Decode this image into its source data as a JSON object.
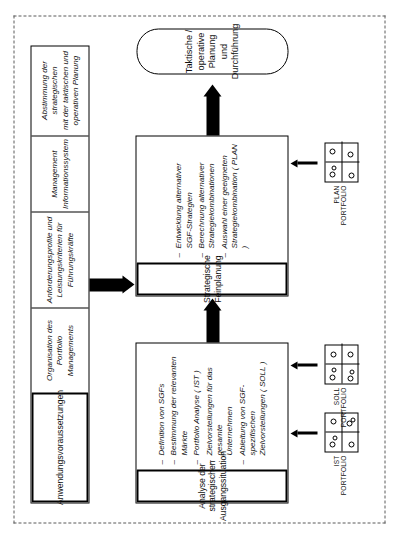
{
  "diagram": {
    "frame_style": "dashed"
  },
  "top_box": {
    "header": "Anwendungsvoraussetzungen",
    "cells": [
      "Organisation des\nPortfolio Managements",
      "Anforderungsprofile und\nLeistungskriterien für\nFührungskräfte",
      "Management\nInformationssystem",
      "Abstimmung der strategischen\nmit der taktischen und\noperativen Planung"
    ]
  },
  "analysis_box": {
    "header": "Analyse der strategischen\nAusgangssituation",
    "items": [
      "Definition von SGFs",
      "Bestimmung der relevanten Märkte",
      "Portfolio Analyse ( IST )",
      "Zielvorstellungen für das gesamte\nUnternehmen",
      "Ableitung von SGF-spezifischen\nZielvorstellungen ( SOLL )"
    ]
  },
  "planning_box": {
    "header": "Strategische Feinplanung",
    "items": [
      "Entwicklung alternativer\nSGF-Strategien",
      "Berechnung alternativer\nStrategiekombinationen",
      "Auswahl einer geeigneten\nStrategiekombination ( PLAN )"
    ]
  },
  "terminator": {
    "label": "Taktische / operative Planung\nund Durchführung"
  },
  "portfolios": [
    {
      "label": "IST\nPORTFOLIO"
    },
    {
      "label": "SOLL\nPORTFOLIO"
    },
    {
      "label": "PLAN\nPORTFOLIO"
    }
  ],
  "bullet_marker": "–",
  "colors": {
    "ink": "#000000",
    "paper": "#ffffff",
    "frame": "#5a5a5a"
  }
}
